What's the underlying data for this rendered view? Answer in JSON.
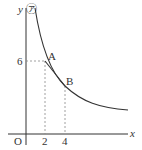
{
  "diagram": {
    "axis_x_label": "x",
    "axis_y_label": "y",
    "curve_label": "㋐",
    "origin_label": "O",
    "x_ticks": [
      "2",
      "4"
    ],
    "y_ticks": [
      "6"
    ],
    "points": [
      {
        "label": "A",
        "x": 2,
        "y": 6
      },
      {
        "label": "B",
        "x": 4,
        "y": 3
      }
    ],
    "colors": {
      "line": "#333333",
      "dashed": "#888888"
    }
  }
}
